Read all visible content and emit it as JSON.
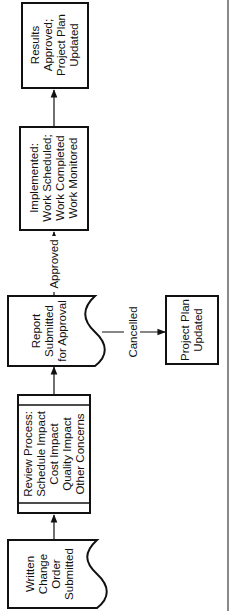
{
  "diagram": {
    "type": "flowchart",
    "orientation": "rotated-90-ccw",
    "nodes": {
      "written": {
        "lines": [
          "Written",
          "Change",
          "Order",
          "Submitted"
        ],
        "shape": "document"
      },
      "review": {
        "lines": [
          "Review Process:",
          "Schedule Impact",
          "Cost Impact",
          "Quality Impact",
          "Other Concerns"
        ],
        "shape": "predefined-process"
      },
      "report": {
        "lines": [
          "Report",
          "Submitted",
          "for Approval"
        ],
        "shape": "document"
      },
      "implemented": {
        "lines": [
          "Implemented:",
          "Work Scheduled;",
          "Work Completed",
          "Work Monitored"
        ],
        "shape": "process"
      },
      "results": {
        "lines": [
          "Results",
          "Approved;",
          "Project Plan",
          "Updated"
        ],
        "shape": "process"
      },
      "plan_updated": {
        "lines": [
          "Project Plan",
          "Updated"
        ],
        "shape": "process"
      }
    },
    "edges": {
      "approved_label": "Approved",
      "cancelled_label": "Cancelled"
    },
    "colors": {
      "stroke": "#111111",
      "background": "#ffffff",
      "page_edge": "#8a8a8a"
    }
  }
}
